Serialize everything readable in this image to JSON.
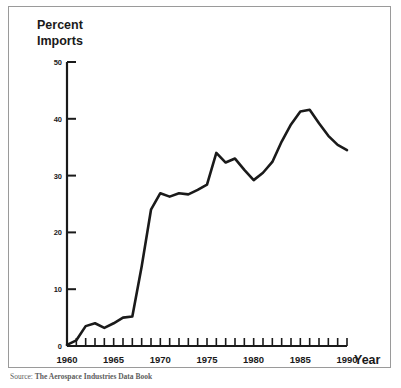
{
  "chart_data": {
    "type": "line",
    "title": "",
    "ylabel": "Percent Imports",
    "xlabel": "Year",
    "ylim": [
      0,
      50
    ],
    "xlim": [
      1960,
      1990
    ],
    "yticks": [
      0,
      10,
      20,
      30,
      40,
      50
    ],
    "ytick_labels": [
      "0",
      "10",
      "20",
      "30",
      "40",
      "50"
    ],
    "xticks": [
      1960,
      1965,
      1970,
      1975,
      1980,
      1985,
      1990
    ],
    "xtick_labels": [
      "1960",
      "1965",
      "1970",
      "1975",
      "1980",
      "1985",
      "1990"
    ],
    "minor_xticks_every": 1,
    "grid": false,
    "legend": "none",
    "line_color": "#1a1a1a",
    "line_width": 2.6,
    "x": [
      1960,
      1961,
      1962,
      1963,
      1964,
      1965,
      1966,
      1967,
      1968,
      1969,
      1970,
      1971,
      1972,
      1973,
      1974,
      1975,
      1976,
      1977,
      1978,
      1979,
      1980,
      1981,
      1982,
      1983,
      1984,
      1985,
      1986,
      1987,
      1988,
      1989,
      1990
    ],
    "values": [
      0.2,
      1.0,
      3.5,
      4.0,
      3.2,
      4.0,
      5.0,
      5.2,
      14.0,
      24.0,
      26.9,
      26.3,
      26.9,
      26.7,
      27.5,
      28.4,
      34.0,
      32.3,
      33.0,
      31.0,
      29.2,
      30.5,
      32.4,
      36.0,
      39.0,
      41.3,
      41.6,
      39.2,
      37.0,
      35.4,
      34.5
    ]
  },
  "labels": {
    "y_axis_title_line1": "Percent",
    "y_axis_title_line2": "Imports",
    "x_axis_title": "Year"
  },
  "caption": {
    "source_label": "Source:",
    "source_text": "The Aerospace Industries Data Book"
  }
}
